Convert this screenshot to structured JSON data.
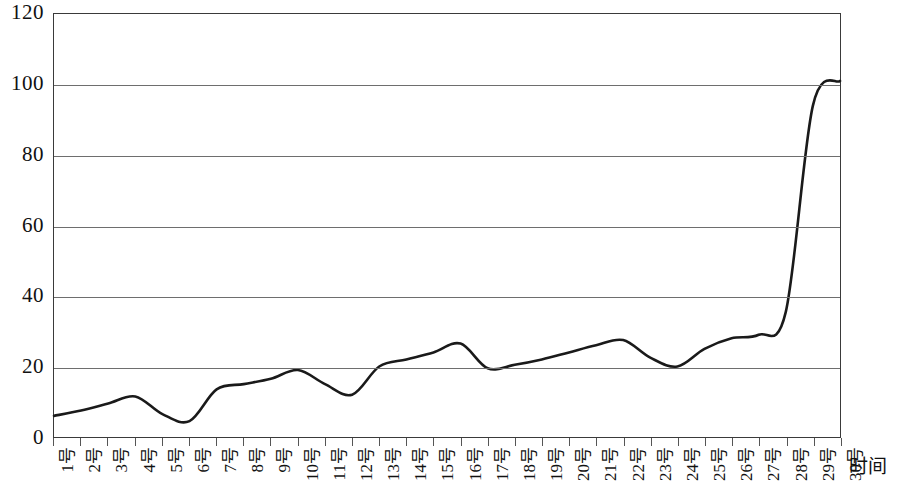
{
  "chart_data": {
    "type": "line",
    "title": "",
    "subtitle": "",
    "xlabel": "时间",
    "ylabel": "",
    "grid": true,
    "legend": false,
    "legend_position": "none",
    "xlim": [
      1,
      30
    ],
    "ylim": [
      0,
      120
    ],
    "ytick_labels": [
      "120",
      "100",
      "80",
      "60",
      "40",
      "20",
      "0"
    ],
    "ytick_values": [
      120,
      100,
      80,
      60,
      40,
      20,
      0
    ],
    "categories": [
      "1号",
      "2号",
      "3号",
      "4号",
      "5号",
      "6号",
      "7号",
      "8号",
      "9号",
      "10号",
      "11号",
      "12号",
      "13号",
      "14号",
      "15号",
      "16号",
      "17号",
      "18号",
      "19号",
      "20号",
      "21号",
      "22号",
      "23号",
      "24号",
      "25号",
      "26号",
      "27号",
      "28号",
      "29号",
      "30号"
    ],
    "series": [
      {
        "name": "",
        "color": "#1a1a1a",
        "values": [
          6,
          7.5,
          9.5,
          11.5,
          6.5,
          4.5,
          13.5,
          15,
          16.5,
          19,
          15,
          12,
          20,
          22,
          24,
          26.5,
          19.5,
          20.5,
          22,
          24,
          26,
          27.5,
          22.5,
          20,
          25,
          28,
          29,
          35.5,
          94,
          101
        ]
      }
    ]
  },
  "axis": {
    "x_title": "时间"
  }
}
